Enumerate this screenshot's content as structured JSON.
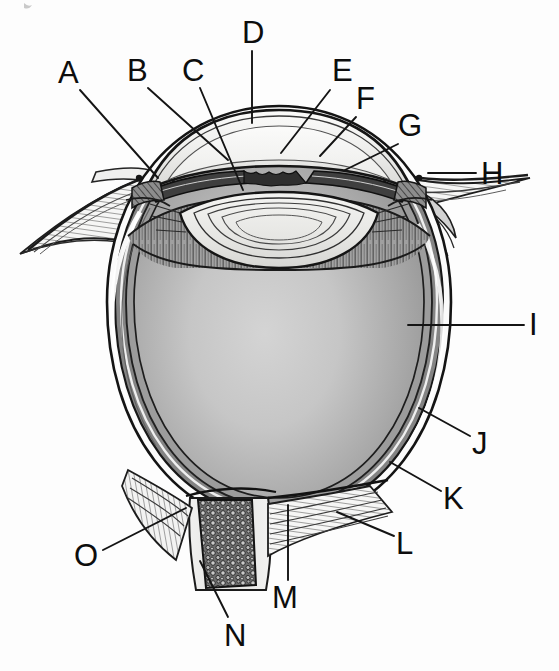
{
  "figure": {
    "kind": "labeled-anatomical-diagram",
    "width": 559,
    "height": 671,
    "background_color": "#fdfdfd",
    "ink_color": "#0d0d0d",
    "label_count": 15
  },
  "palette": {
    "ink": "#111111",
    "leader_line": "#1a1a1a",
    "vitreous_center": "#cfcfcf",
    "vitreous_edge": "#8e8e8e",
    "sclera_white": "#fbfbfb",
    "choroid_gray": "#7c7c7c",
    "ciliary_gray": "#9a9a9a",
    "lens_fill": "#e8e8e6",
    "cornea_fill": "#f2f2f0",
    "aqueous_fill": "#fafafa",
    "iris_dark": "#4a4a4a",
    "optic_nerve_dark": "#3d3d3d",
    "page_white": "#ffffff"
  },
  "labels": [
    {
      "id": "A",
      "text": "A",
      "x": 58,
      "y": 57,
      "leader": {
        "x1": 80,
        "y1": 90,
        "x2": 158,
        "y2": 178
      }
    },
    {
      "id": "B",
      "text": "B",
      "x": 127,
      "y": 55,
      "leader": {
        "x1": 148,
        "y1": 88,
        "x2": 228,
        "y2": 160
      }
    },
    {
      "id": "C",
      "text": "C",
      "x": 182,
      "y": 55,
      "leader": {
        "x1": 200,
        "y1": 88,
        "x2": 243,
        "y2": 190
      }
    },
    {
      "id": "D",
      "text": "D",
      "x": 242,
      "y": 17,
      "leader": {
        "x1": 252,
        "y1": 51,
        "x2": 252,
        "y2": 123
      }
    },
    {
      "id": "E",
      "text": "E",
      "x": 332,
      "y": 55,
      "leader": {
        "x1": 330,
        "y1": 90,
        "x2": 281,
        "y2": 153
      }
    },
    {
      "id": "F",
      "text": "F",
      "x": 356,
      "y": 83,
      "leader": {
        "x1": 356,
        "y1": 117,
        "x2": 320,
        "y2": 156
      }
    },
    {
      "id": "G",
      "text": "G",
      "x": 398,
      "y": 110,
      "leader": {
        "x1": 398,
        "y1": 144,
        "x2": 345,
        "y2": 170
      }
    },
    {
      "id": "H",
      "text": "H",
      "x": 481,
      "y": 158,
      "leader": {
        "x1": 476,
        "y1": 173,
        "x2": 428,
        "y2": 173
      }
    },
    {
      "id": "I",
      "text": "I",
      "x": 529,
      "y": 309,
      "leader": {
        "x1": 524,
        "y1": 325,
        "x2": 408,
        "y2": 325
      }
    },
    {
      "id": "J",
      "text": "J",
      "x": 472,
      "y": 428,
      "leader": {
        "x1": 470,
        "y1": 436,
        "x2": 419,
        "y2": 408
      }
    },
    {
      "id": "K",
      "text": "K",
      "x": 443,
      "y": 483,
      "leader": {
        "x1": 441,
        "y1": 491,
        "x2": 390,
        "y2": 462
      }
    },
    {
      "id": "L",
      "text": "L",
      "x": 396,
      "y": 528,
      "leader": {
        "x1": 394,
        "y1": 536,
        "x2": 337,
        "y2": 512
      }
    },
    {
      "id": "M",
      "text": "M",
      "x": 272,
      "y": 582,
      "leader": {
        "x1": 288,
        "y1": 580,
        "x2": 288,
        "y2": 505
      }
    },
    {
      "id": "N",
      "text": "N",
      "x": 224,
      "y": 620,
      "leader": {
        "x1": 228,
        "y1": 617,
        "x2": 200,
        "y2": 561
      }
    },
    {
      "id": "O",
      "text": "O",
      "x": 74,
      "y": 540,
      "leader": {
        "x1": 103,
        "y1": 550,
        "x2": 186,
        "y2": 508
      }
    }
  ]
}
